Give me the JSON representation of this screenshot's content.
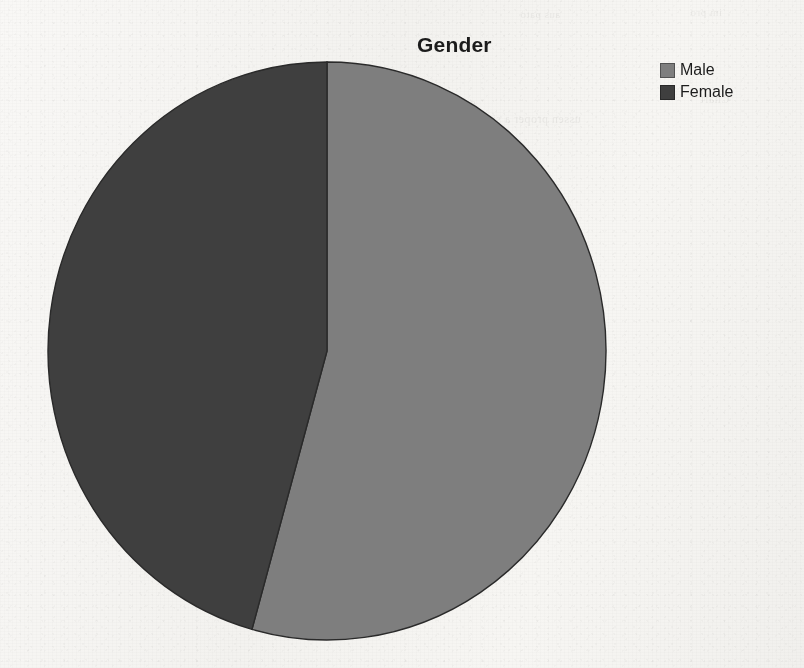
{
  "document": {
    "medium": "scanned-page",
    "background_color": "#f5f4f1",
    "ghost_text": [
      {
        "text": "aus pato",
        "x": 520,
        "y": 8,
        "size": 11
      },
      {
        "text": "im pro",
        "x": 690,
        "y": 6,
        "size": 11
      },
      {
        "text": "erly",
        "x": 455,
        "y": 96,
        "size": 12
      },
      {
        "text": "ussen proper a situation",
        "x": 455,
        "y": 112,
        "size": 12
      },
      {
        "text": "Chart",
        "x": 700,
        "y": 92,
        "size": 12
      }
    ]
  },
  "chart_data": {
    "type": "pie",
    "title": "Gender",
    "xlabel": "",
    "ylabel": "",
    "legend_position": "right",
    "grid": false,
    "categories": [
      "Male",
      "Female"
    ],
    "values": [
      54.4,
      45.6
    ],
    "labels_shown": false,
    "start_angle_deg": 90,
    "direction": "clockwise",
    "slices": [
      {
        "name": "Male",
        "value": 54.4,
        "percent": "54.4%",
        "color": "#7e7e7e",
        "start_deg": 0,
        "sweep_deg": 195.6
      },
      {
        "name": "Female",
        "value": 45.6,
        "percent": "45.6%",
        "color": "#3f3f3f",
        "start_deg": 195.6,
        "sweep_deg": 164.4
      }
    ],
    "geometry": {
      "center_x": 327,
      "center_y": 351,
      "radius": 279,
      "radius_y": 289
    }
  },
  "legend": {
    "items": [
      {
        "label": "Male",
        "color": "#7e7e7e",
        "swatch_name": "legend-swatch-male"
      },
      {
        "label": "Female",
        "color": "#3f3f3f",
        "swatch_name": "legend-swatch-female"
      }
    ]
  }
}
